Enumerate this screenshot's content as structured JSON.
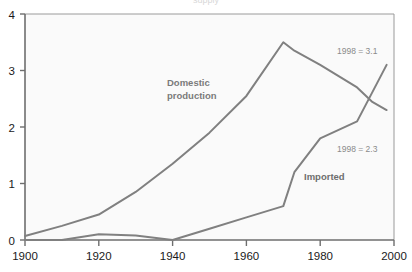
{
  "chart_data": {
    "type": "line",
    "title": "",
    "xlabel": "",
    "ylabel": "",
    "xlim": [
      1900,
      2000
    ],
    "ylim": [
      0,
      4
    ],
    "grid": false,
    "legend_position": "inline-annotations",
    "x_ticks": [
      "1900",
      "1920",
      "1940",
      "1960",
      "1980",
      "2000"
    ],
    "y_ticks": [
      "0",
      "1",
      "2",
      "3",
      "4"
    ],
    "series": [
      {
        "name": "Domestic production",
        "color": "#808080",
        "x": [
          1900,
          1910,
          1920,
          1930,
          1940,
          1950,
          1960,
          1970,
          1973,
          1980,
          1985,
          1990,
          1994,
          1998
        ],
        "values": [
          0.07,
          0.25,
          0.45,
          0.85,
          1.35,
          1.9,
          2.55,
          3.5,
          3.35,
          3.1,
          2.9,
          2.7,
          2.45,
          2.3
        ],
        "end_label": "1998 = 2.3"
      },
      {
        "name": "Imported",
        "color": "#808080",
        "x": [
          1900,
          1910,
          1920,
          1930,
          1940,
          1950,
          1960,
          1970,
          1973,
          1980,
          1990,
          1994,
          1998
        ],
        "values": [
          0.0,
          0.0,
          0.1,
          0.08,
          0.0,
          0.2,
          0.4,
          0.6,
          1.2,
          1.8,
          2.1,
          2.6,
          3.1
        ],
        "end_label": "1998 = 3.1"
      }
    ],
    "annotations": [
      {
        "text": "1998 = 3.1",
        "x": 1986,
        "y": 3.62
      },
      {
        "text": "1998 = 2.3",
        "x": 1986,
        "y": 1.78
      },
      {
        "text": "Domestic",
        "x": 1941,
        "y": 2.78
      },
      {
        "text": "production",
        "x": 1941,
        "y": 2.58
      },
      {
        "text": "Imported",
        "x": 1973,
        "y": 1.28
      }
    ],
    "clipped_top_text": "supply"
  },
  "labels": {
    "series_domestic_line1": "Domestic",
    "series_domestic_line2": "production",
    "series_imported": "Imported",
    "annotation_top": "1998 = 3.1",
    "annotation_mid": "1998 = 2.3",
    "clipped_title": "supply"
  },
  "axes": {
    "y": [
      "4",
      "3",
      "2",
      "1",
      "0"
    ],
    "x": [
      "1900",
      "1920",
      "1940",
      "1960",
      "1980",
      "2000"
    ]
  },
  "colors": {
    "line": "#808080",
    "axis": "#666666",
    "plot_bg": "#fafafa",
    "annotation_text": "#8a8a8a",
    "tick_text": "#1a1a1a"
  }
}
